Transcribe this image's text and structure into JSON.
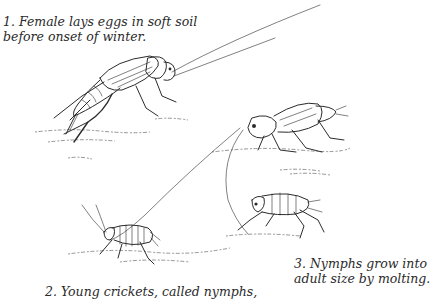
{
  "illustration": {
    "subject": "cricket life cycle",
    "stages": [
      {
        "number": "1",
        "caption_line1": "1. Female lays eggs in soft soil",
        "caption_line2": "before onset of winter."
      },
      {
        "number": "2",
        "caption_line1": "2. Young crickets, called nymphs,"
      },
      {
        "number": "3",
        "caption_line1": "3. Nymphs grow into",
        "caption_line2": "adult size by molting."
      }
    ],
    "figures": [
      "adult-female-cricket",
      "adult-cricket-with-wings",
      "nymph-cricket-left",
      "nymph-cricket-right"
    ]
  }
}
